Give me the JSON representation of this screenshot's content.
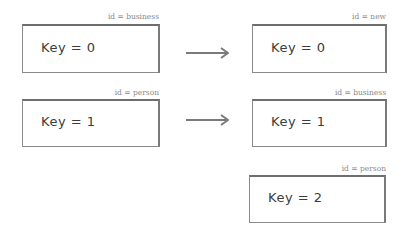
{
  "diagram": {
    "left_column": [
      {
        "id_label": "id = business",
        "key_label": "Key = 0"
      },
      {
        "id_label": "id = person",
        "key_label": "Key = 1"
      }
    ],
    "right_column": [
      {
        "id_label": "id = new",
        "key_label": "Key = 0"
      },
      {
        "id_label": "id = business",
        "key_label": "Key = 1"
      },
      {
        "id_label": "id = person",
        "key_label": "Key = 2"
      }
    ],
    "arrows": [
      {
        "from": "left_column.0",
        "to": "right_column.0",
        "icon": "arrow-right-icon"
      },
      {
        "from": "left_column.1",
        "to": "right_column.1",
        "icon": "arrow-right-icon"
      }
    ]
  }
}
